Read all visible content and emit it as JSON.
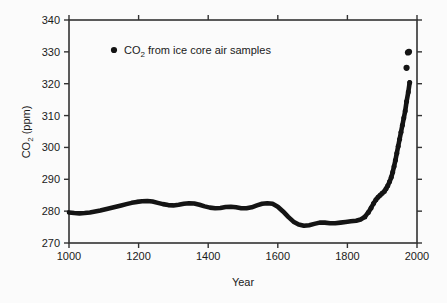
{
  "figure": {
    "background_color": "#fbfbfb",
    "frame_color": "#333333",
    "data_color": "#141414"
  },
  "chart_data": {
    "type": "line",
    "title": "",
    "subtitle": "",
    "xlabel": "Year",
    "ylabel": "CO2 (ppm)",
    "ylabel_parts": {
      "main": "CO",
      "sub": "2",
      "unit": " (ppm)"
    },
    "xlim": [
      1000,
      2000
    ],
    "ylim": [
      270,
      340
    ],
    "xticks": [
      1000,
      1200,
      1400,
      1600,
      1800,
      2000
    ],
    "xtick_labels": [
      "1000",
      "1200",
      "1400",
      "1600",
      "1800",
      "2000"
    ],
    "yticks": [
      270,
      280,
      290,
      300,
      310,
      320,
      330,
      340
    ],
    "ytick_labels": [
      "270",
      "280",
      "290",
      "300",
      "310",
      "320",
      "330",
      "340"
    ],
    "grid": false,
    "legend_position": "upper left",
    "legend": [
      {
        "label": "CO2 from ice core air samples",
        "label_parts": {
          "main": "CO",
          "sub": "2",
          "rest": " from ice core air samples"
        },
        "marker": "filled-circle",
        "color": "#141414"
      }
    ],
    "series": [
      {
        "name": "CO2 from ice core air samples",
        "marker": "filled-circle",
        "color": "#141414",
        "x": [
          1000,
          1015,
          1030,
          1045,
          1060,
          1075,
          1090,
          1105,
          1120,
          1135,
          1150,
          1165,
          1180,
          1195,
          1210,
          1225,
          1240,
          1255,
          1270,
          1285,
          1300,
          1315,
          1330,
          1345,
          1360,
          1375,
          1390,
          1405,
          1420,
          1435,
          1450,
          1465,
          1480,
          1495,
          1510,
          1525,
          1540,
          1555,
          1570,
          1585,
          1600,
          1615,
          1630,
          1645,
          1660,
          1675,
          1690,
          1705,
          1720,
          1735,
          1750,
          1765,
          1780,
          1795,
          1810,
          1825,
          1838,
          1850,
          1860,
          1868,
          1875,
          1882,
          1888,
          1894,
          1900,
          1906,
          1911,
          1916,
          1921,
          1926,
          1930,
          1934,
          1938,
          1942,
          1946,
          1950,
          1954,
          1958,
          1962,
          1966,
          1970,
          1975,
          1979
        ],
        "y": [
          279.6,
          279.4,
          279.3,
          279.4,
          279.6,
          279.9,
          280.2,
          280.6,
          281.0,
          281.4,
          281.8,
          282.2,
          282.6,
          282.9,
          283.1,
          283.2,
          283.0,
          282.6,
          282.2,
          281.9,
          281.8,
          282.0,
          282.3,
          282.5,
          282.4,
          282.0,
          281.5,
          281.1,
          280.9,
          281.0,
          281.3,
          281.4,
          281.2,
          280.9,
          280.9,
          281.2,
          281.8,
          282.3,
          282.5,
          282.3,
          281.4,
          279.9,
          278.2,
          276.7,
          275.8,
          275.4,
          275.6,
          276.0,
          276.4,
          276.4,
          276.2,
          276.2,
          276.4,
          276.6,
          276.8,
          277.0,
          277.4,
          278.2,
          279.6,
          281.0,
          282.4,
          283.6,
          284.4,
          285.0,
          285.6,
          286.2,
          287.0,
          288.0,
          289.2,
          290.6,
          292.2,
          294.0,
          296.0,
          298.2,
          300.4,
          302.6,
          304.8,
          307.0,
          309.2,
          311.4,
          314.4,
          317.4,
          320.4
        ],
        "extra_points": {
          "comment": "isolated upper-right samples",
          "x": [
            1970,
            1974,
            1977
          ],
          "y": [
            325.0,
            329.8,
            330.0
          ]
        }
      }
    ],
    "annotations": []
  },
  "axes": {
    "x_axis_name": "year-axis",
    "y_axis_name": "co2-axis"
  }
}
